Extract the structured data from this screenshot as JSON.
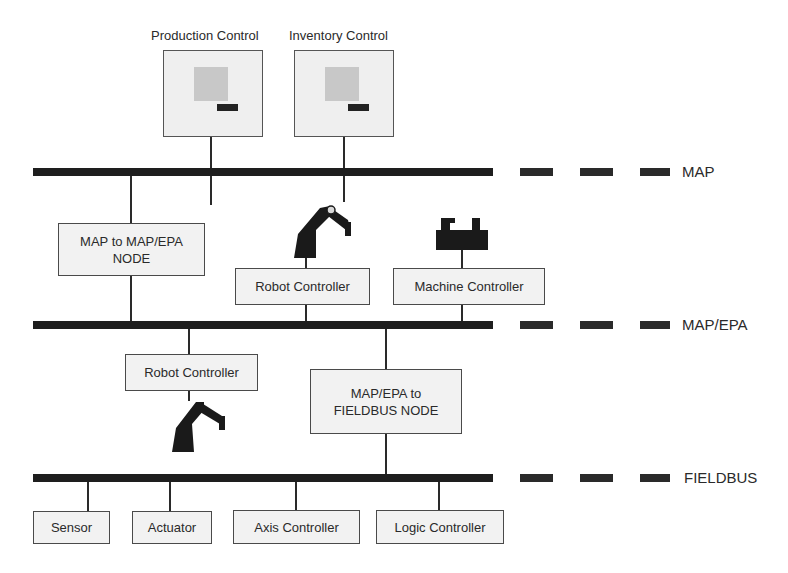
{
  "diagram": {
    "type": "network-hierarchy",
    "colors": {
      "bus": "#1e1e1e",
      "box_fill": "#f2f2f2",
      "box_border": "#4a4a4a",
      "screen": "#c8c8c8"
    },
    "workstations": [
      {
        "label": "Production Control",
        "icon": "computer-icon"
      },
      {
        "label": "Inventory Control",
        "icon": "computer-icon"
      }
    ],
    "buses": [
      {
        "id": "map",
        "label": "MAP"
      },
      {
        "id": "map_epa",
        "label": "MAP/EPA"
      },
      {
        "id": "fieldbus",
        "label": "FIELDBUS"
      }
    ],
    "map_level": {
      "gateway": {
        "line1": "MAP to MAP/EPA",
        "line2": "NODE"
      },
      "robot_controller": {
        "label": "Robot Controller",
        "icon": "robot-arm-icon"
      },
      "machine_controller": {
        "label": "Machine Controller",
        "icon": "machine-tool-icon"
      }
    },
    "epa_level": {
      "robot_controller": {
        "label": "Robot Controller",
        "icon": "robot-arm-icon"
      },
      "gateway": {
        "line1": "MAP/EPA to",
        "line2": "FIELDBUS NODE"
      }
    },
    "fieldbus_devices": [
      {
        "label": "Sensor"
      },
      {
        "label": "Actuator"
      },
      {
        "label": "Axis Controller"
      },
      {
        "label": "Logic Controller"
      }
    ]
  }
}
